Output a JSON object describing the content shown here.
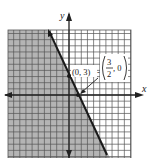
{
  "chart_data": {
    "type": "line",
    "title": "",
    "xlabel": "x",
    "ylabel": "y",
    "xlim": [
      -10,
      10
    ],
    "ylim": [
      -10,
      10.5
    ],
    "grid": true,
    "grid_step": 1,
    "series": [
      {
        "name": "boundary line",
        "equation": "y = -2x + 3",
        "style": "solid",
        "points": [
          [
            -3.5,
            10
          ],
          [
            6.1,
            -9.2
          ]
        ]
      }
    ],
    "shaded_region": "left of line (y < -2x + 3)",
    "shade_color": "#b4b4b4",
    "annotations": [
      {
        "text": "(0, 3)",
        "point": [
          0,
          3
        ]
      },
      {
        "text": "(3/2, 0)",
        "point": [
          1.5,
          0
        ],
        "numerator": "3",
        "denominator": "2",
        "rest": ", 0"
      }
    ]
  },
  "labels": {
    "x_axis": "x",
    "y_axis": "y",
    "point_a": "(0, 3)",
    "point_b_num": "3",
    "point_b_den": "2",
    "point_b_rest": ", 0"
  },
  "colors": {
    "shade": "#b4b4b4",
    "grid": "#444444",
    "line": "#1a1a1a"
  }
}
